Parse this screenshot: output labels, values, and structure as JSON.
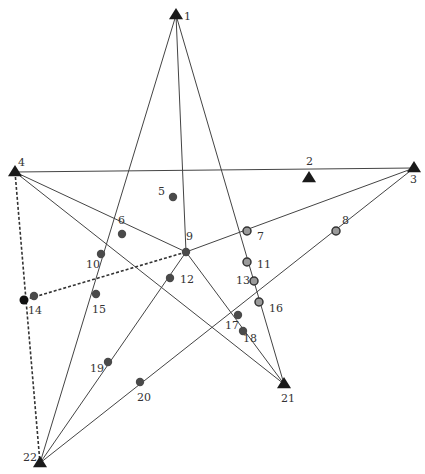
{
  "diagram": {
    "type": "network-graph",
    "colors": {
      "line": "#444444",
      "dashed_line": "#333333",
      "triangle": "#1a1a1a",
      "dot": "#4a4a4a",
      "ring_fill": "#9a9a9a",
      "ring_stroke": "#333333",
      "label": "#333333"
    },
    "triangles": [
      {
        "id": "1",
        "x": 176,
        "y": 15,
        "lx": 184,
        "ly": 20
      },
      {
        "id": "2",
        "x": 309,
        "y": 178,
        "lx": 306,
        "ly": 165
      },
      {
        "id": "3",
        "x": 414,
        "y": 168,
        "lx": 410,
        "ly": 183
      },
      {
        "id": "4",
        "x": 15,
        "y": 172,
        "lx": 18,
        "ly": 166
      },
      {
        "id": "21",
        "x": 284,
        "y": 384,
        "lx": 281,
        "ly": 402
      },
      {
        "id": "22",
        "x": 40,
        "y": 463,
        "lx": 23,
        "ly": 461
      }
    ],
    "dots": [
      {
        "id": "5",
        "x": 173,
        "y": 197,
        "lx": 158,
        "ly": 195,
        "style": "dot"
      },
      {
        "id": "6",
        "x": 122,
        "y": 234,
        "lx": 118,
        "ly": 224,
        "style": "dot"
      },
      {
        "id": "7",
        "x": 247,
        "y": 231,
        "lx": 257,
        "ly": 240,
        "style": "ring"
      },
      {
        "id": "8",
        "x": 336,
        "y": 231,
        "lx": 342,
        "ly": 224,
        "style": "ring"
      },
      {
        "id": "9",
        "x": 186,
        "y": 252,
        "lx": 186,
        "ly": 240,
        "style": "dot"
      },
      {
        "id": "10",
        "x": 101,
        "y": 254,
        "lx": 86,
        "ly": 268,
        "style": "dot"
      },
      {
        "id": "11",
        "x": 247,
        "y": 262,
        "lx": 257,
        "ly": 268,
        "style": "ring"
      },
      {
        "id": "12",
        "x": 170,
        "y": 278,
        "lx": 180,
        "ly": 283,
        "style": "dot"
      },
      {
        "id": "13",
        "x": 254,
        "y": 281,
        "lx": 236,
        "ly": 284,
        "style": "ring"
      },
      {
        "id": "14a",
        "x": 24,
        "y": 300,
        "style": "black"
      },
      {
        "id": "14",
        "x": 34,
        "y": 296,
        "lx": 28,
        "ly": 314,
        "style": "dot"
      },
      {
        "id": "15",
        "x": 96,
        "y": 294,
        "lx": 92,
        "ly": 313,
        "style": "dot"
      },
      {
        "id": "16",
        "x": 259,
        "y": 302,
        "lx": 269,
        "ly": 312,
        "style": "ring"
      },
      {
        "id": "17",
        "x": 238,
        "y": 315,
        "lx": 225,
        "ly": 329,
        "style": "dot"
      },
      {
        "id": "18",
        "x": 243,
        "y": 331,
        "lx": 243,
        "ly": 342,
        "style": "dot"
      },
      {
        "id": "19",
        "x": 108,
        "y": 362,
        "lx": 90,
        "ly": 372,
        "style": "dot"
      },
      {
        "id": "20",
        "x": 140,
        "y": 382,
        "lx": 137,
        "ly": 401,
        "style": "dot"
      }
    ],
    "edges": [
      {
        "from": [
          176,
          15
        ],
        "to": [
          40,
          463
        ],
        "dashed": false
      },
      {
        "from": [
          176,
          15
        ],
        "to": [
          186,
          252
        ],
        "dashed": false
      },
      {
        "from": [
          176,
          15
        ],
        "to": [
          284,
          384
        ],
        "dashed": false
      },
      {
        "from": [
          15,
          172
        ],
        "to": [
          414,
          168
        ],
        "dashed": false
      },
      {
        "from": [
          15,
          172
        ],
        "to": [
          186,
          252
        ],
        "dashed": false
      },
      {
        "from": [
          15,
          172
        ],
        "to": [
          284,
          384
        ],
        "dashed": false
      },
      {
        "from": [
          186,
          252
        ],
        "to": [
          414,
          168
        ],
        "dashed": false
      },
      {
        "from": [
          186,
          252
        ],
        "to": [
          284,
          384
        ],
        "dashed": false
      },
      {
        "from": [
          186,
          252
        ],
        "to": [
          40,
          463
        ],
        "dashed": false
      },
      {
        "from": [
          414,
          168
        ],
        "to": [
          40,
          463
        ],
        "dashed": false
      },
      {
        "from": [
          186,
          252
        ],
        "to": [
          24,
          300
        ],
        "dashed": true
      },
      {
        "from": [
          15,
          172
        ],
        "to": [
          40,
          463
        ],
        "dashed": true
      }
    ]
  }
}
